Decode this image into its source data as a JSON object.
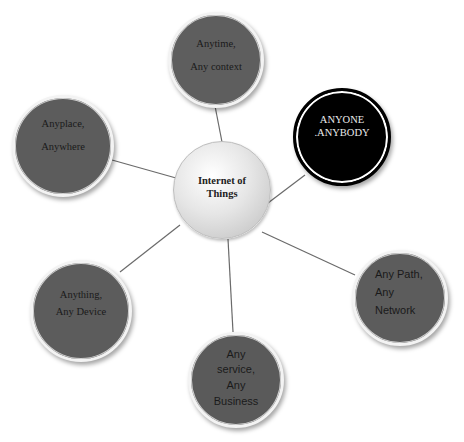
{
  "diagram": {
    "type": "hub-and-spoke",
    "colors": {
      "background": "#ffffff",
      "satellite_fill": "#5c5c5c",
      "highlight_fill": "#000000",
      "center_fill": "#e0e0e0",
      "connector": "#6a6a6a"
    },
    "center": {
      "id": "iot",
      "lines": [
        "Internet of",
        "Things"
      ]
    },
    "nodes": [
      {
        "id": "anytime",
        "lines": [
          "Anytime,",
          "Any context"
        ]
      },
      {
        "id": "anyone",
        "lines": [
          "ANYONE",
          ".ANYBODY"
        ]
      },
      {
        "id": "anyplace",
        "lines": [
          "Anyplace,",
          "Anywhere"
        ]
      },
      {
        "id": "anything",
        "lines": [
          "Anything,",
          "Any Device"
        ]
      },
      {
        "id": "anypath",
        "lines": [
          "Any Path,",
          "Any",
          "Network"
        ]
      },
      {
        "id": "anyservice",
        "lines": [
          "Any",
          "service,",
          "Any",
          "Business"
        ]
      }
    ]
  }
}
